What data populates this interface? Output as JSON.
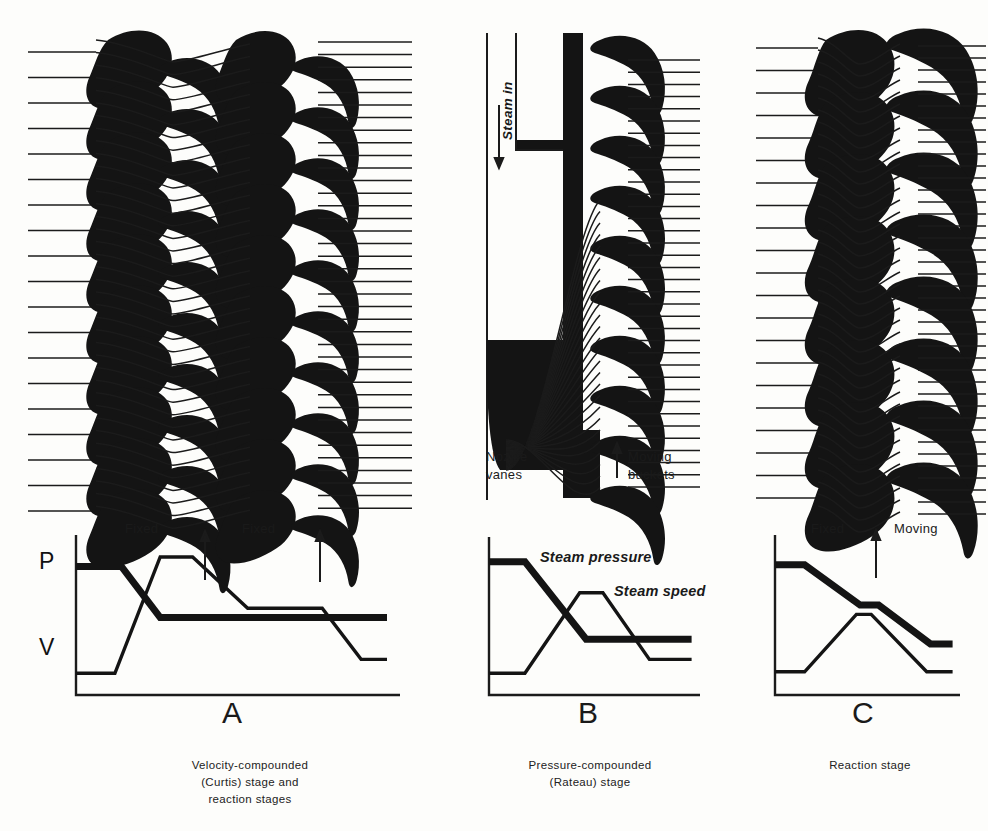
{
  "figure": {
    "background_color": "#fdfdfb",
    "ink_color": "#111111"
  },
  "panels": [
    {
      "id": "A",
      "letter": "A",
      "caption_lines": [
        "Velocity-compounded",
        "(Curtis) stage and",
        "reaction stages"
      ],
      "blade_rows": [
        "fixed",
        "moving",
        "fixed",
        "moving"
      ],
      "row_labels": [
        {
          "text": "Fixed",
          "x": 150,
          "y": 523
        },
        {
          "text": "Fixed",
          "x": 250,
          "y": 523
        }
      ],
      "arrow_markers": [
        {
          "x": 205,
          "y": 530,
          "direction": "up"
        },
        {
          "x": 320,
          "y": 530,
          "direction": "up"
        }
      ]
    },
    {
      "id": "B",
      "letter": "B",
      "caption_lines": [
        "Pressure-compounded",
        "(Rateau) stage"
      ],
      "annotations": [
        {
          "name": "steam-in",
          "text": "Steam in",
          "orientation": "vertical",
          "arrow": "down"
        },
        {
          "name": "nozzle-vanes",
          "text": "Nozzle\nvanes",
          "line1": "Nozzle",
          "line2": "vanes"
        },
        {
          "name": "moving-buckets",
          "text": "Moving buckets",
          "line1": "Moving",
          "line2": "buckets",
          "arrow": "up"
        }
      ]
    },
    {
      "id": "C",
      "letter": "C",
      "caption_lines": [
        "Reaction  stage"
      ],
      "row_labels": [
        {
          "text": "Fixed",
          "x": 812,
          "y": 523
        },
        {
          "text": "Moving",
          "x": 900,
          "y": 523
        }
      ],
      "arrow_markers": [
        {
          "x": 876,
          "y": 530,
          "direction": "up"
        }
      ]
    }
  ],
  "axis_labels": {
    "pressure": "P",
    "velocity": "V"
  },
  "curve_legend": {
    "pressure_label": "Steam pressure",
    "speed_label": "Steam speed",
    "pressure_style": "thick",
    "speed_style": "thin"
  },
  "chart_data": [
    {
      "id": "A",
      "type": "line",
      "title": "Velocity-compounded (Curtis) stage and reaction stages",
      "xlabel": "",
      "ylabel": "",
      "xlim": [
        0,
        10
      ],
      "ylim": [
        0,
        10
      ],
      "grid": false,
      "legend_position": "none",
      "series": [
        {
          "name": "Steam pressure",
          "style": "thick",
          "x": [
            0.0,
            1.4,
            2.6,
            9.6
          ],
          "values": [
            8.3,
            8.3,
            5.0,
            5.0
          ]
        },
        {
          "name": "Steam speed",
          "style": "thin",
          "x": [
            0.0,
            1.2,
            2.6,
            3.6,
            5.3,
            7.6,
            8.8,
            9.6
          ],
          "values": [
            1.4,
            1.4,
            8.9,
            8.9,
            5.6,
            5.6,
            2.3,
            2.3
          ]
        }
      ],
      "annotations": [
        "Fixed",
        "Fixed"
      ]
    },
    {
      "id": "B",
      "type": "line",
      "title": "Pressure-compounded (Rateau) stage",
      "xlabel": "",
      "ylabel": "",
      "xlim": [
        0,
        10
      ],
      "ylim": [
        0,
        10
      ],
      "grid": false,
      "legend_position": "inline",
      "series": [
        {
          "name": "Steam pressure",
          "style": "thick",
          "x": [
            0.0,
            1.7,
            4.6,
            9.6
          ],
          "values": [
            8.6,
            8.6,
            3.6,
            3.6
          ]
        },
        {
          "name": "Steam speed",
          "style": "thin",
          "x": [
            0.0,
            1.7,
            4.3,
            5.4,
            7.6,
            9.6
          ],
          "values": [
            1.4,
            1.4,
            6.6,
            6.6,
            2.3,
            2.3
          ]
        }
      ]
    },
    {
      "id": "C",
      "type": "line",
      "title": "Reaction stage",
      "xlabel": "",
      "ylabel": "",
      "xlim": [
        0,
        10
      ],
      "ylim": [
        0,
        10
      ],
      "grid": false,
      "legend_position": "none",
      "series": [
        {
          "name": "Steam pressure",
          "style": "thick",
          "x": [
            0.0,
            1.6,
            4.6,
            5.6,
            8.4,
            9.6
          ],
          "values": [
            8.4,
            8.4,
            5.8,
            5.8,
            3.3,
            3.3
          ]
        },
        {
          "name": "Steam speed",
          "style": "thin",
          "x": [
            0.0,
            1.6,
            4.4,
            5.2,
            8.2,
            9.6
          ],
          "values": [
            1.5,
            1.5,
            5.2,
            5.2,
            1.5,
            1.5
          ]
        }
      ],
      "annotations": [
        "Fixed",
        "Moving"
      ]
    }
  ]
}
